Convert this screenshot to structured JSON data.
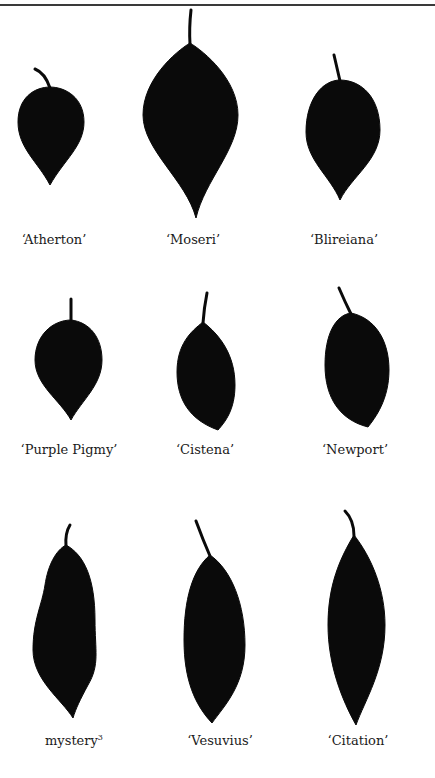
{
  "figure": {
    "type": "leaf silhouette comparison plate",
    "layout": {
      "rows": 3,
      "columns": 3
    },
    "leaf_color": "#0a0a0a",
    "background": "#ffffff",
    "rows": [
      {
        "leaves": [
          {
            "label": "‘Atherton’",
            "name": "atherton"
          },
          {
            "label": "‘Moseri’",
            "name": "moseri"
          },
          {
            "label": "‘Blireiana’",
            "name": "blireiana"
          }
        ]
      },
      {
        "leaves": [
          {
            "label": "‘Purple Pigmy’",
            "name": "purple-pigmy"
          },
          {
            "label": "‘Cistena’",
            "name": "cistena"
          },
          {
            "label": "‘Newport’",
            "name": "newport"
          }
        ]
      },
      {
        "leaves": [
          {
            "label": "mystery",
            "superscript": "3",
            "name": "mystery"
          },
          {
            "label": "‘Vesuvius’",
            "name": "vesuvius"
          },
          {
            "label": "‘Citation’",
            "name": "citation"
          }
        ]
      }
    ]
  }
}
